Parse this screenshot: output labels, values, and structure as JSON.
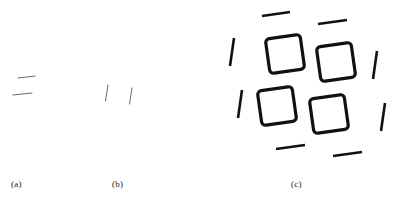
{
  "figure": {
    "background_color": "#ffffff",
    "ink_color": "#111111",
    "faint_ink_color": "#5c5c5c",
    "width": 397,
    "height": 203
  },
  "panels": [
    {
      "id": "a",
      "caption": "(a)",
      "description": "two faint short horizontal dashes",
      "element_count": 2,
      "stroke_color": "#6a6a6a",
      "stroke_width": 1.0,
      "elements": [
        {
          "name": "dash-upper",
          "x1": 18,
          "y1": 78,
          "x2": 35,
          "y2": 76,
          "angle_deg": -6
        },
        {
          "name": "dash-lower",
          "x1": 13,
          "y1": 95,
          "x2": 32,
          "y2": 93,
          "angle_deg": -6
        }
      ]
    },
    {
      "id": "b",
      "caption": "(b)",
      "description": "two faint short near-vertical dashes",
      "element_count": 2,
      "stroke_color": "#6a6a6a",
      "stroke_width": 1.0,
      "elements": [
        {
          "name": "dash-left",
          "x1": 108,
          "y1": 85,
          "x2": 105,
          "y2": 101,
          "angle_deg": 10
        },
        {
          "name": "dash-right",
          "x1": 132,
          "y1": 88,
          "x2": 129,
          "y2": 104,
          "angle_deg": 10
        }
      ]
    },
    {
      "id": "c",
      "caption": "(c)",
      "description": "four rotated rounded squares in a 2x2 grid surrounded by eight dashes implying a larger square",
      "square_count": 4,
      "dash_count": 8,
      "stroke_color": "#111111",
      "square_stroke_width": 3.2,
      "dash_stroke_width": 2.6,
      "square_size": 35,
      "square_corner_radius": 4,
      "square_rotation_deg": -8,
      "squares": [
        {
          "name": "square-top-left",
          "cx": 285,
          "cy": 54
        },
        {
          "name": "square-top-right",
          "cx": 336,
          "cy": 62
        },
        {
          "name": "square-bottom-left",
          "cx": 277,
          "cy": 106
        },
        {
          "name": "square-bottom-right",
          "cx": 329,
          "cy": 114
        }
      ],
      "dashes": [
        {
          "name": "dash-top-left",
          "x1": 262,
          "y1": 16,
          "x2": 290,
          "y2": 12
        },
        {
          "name": "dash-top-right",
          "x1": 318,
          "y1": 24,
          "x2": 347,
          "y2": 20
        },
        {
          "name": "dash-right-upper",
          "x1": 377,
          "y1": 51,
          "x2": 373,
          "y2": 79
        },
        {
          "name": "dash-right-lower",
          "x1": 385,
          "y1": 103,
          "x2": 381,
          "y2": 131
        },
        {
          "name": "dash-bottom-right",
          "x1": 333,
          "y1": 156,
          "x2": 362,
          "y2": 152
        },
        {
          "name": "dash-bottom-left",
          "x1": 276,
          "y1": 149,
          "x2": 305,
          "y2": 145
        },
        {
          "name": "dash-left-lower",
          "x1": 242,
          "y1": 90,
          "x2": 238,
          "y2": 118
        },
        {
          "name": "dash-left-upper",
          "x1": 234,
          "y1": 38,
          "x2": 230,
          "y2": 66
        }
      ]
    }
  ]
}
